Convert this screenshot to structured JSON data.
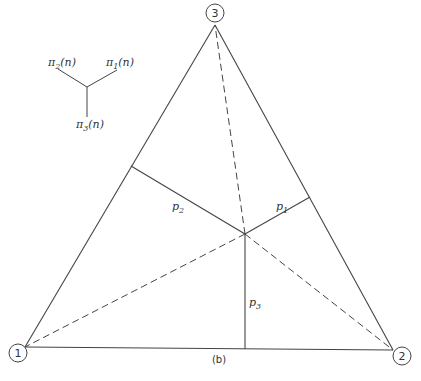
{
  "diagram": {
    "caption": "(b)",
    "colors": {
      "line": "#444444",
      "background": "#ffffff"
    },
    "vertices": [
      {
        "id": "1",
        "label": "1",
        "x": 25,
        "y": 347,
        "circle_x": 18,
        "circle_y": 353
      },
      {
        "id": "2",
        "label": "2",
        "x": 393,
        "y": 350,
        "circle_x": 402,
        "circle_y": 356
      },
      {
        "id": "3",
        "label": "3",
        "x": 215,
        "y": 25,
        "circle_x": 215,
        "circle_y": 13
      }
    ],
    "interior_point": {
      "x": 245,
      "y": 234
    },
    "perpendiculars": [
      {
        "label": "p",
        "sub": "1",
        "foot_x": 310,
        "foot_y": 197,
        "label_x": 276,
        "label_y": 210
      },
      {
        "label": "p",
        "sub": "2",
        "foot_x": 131,
        "foot_y": 166,
        "label_x": 172,
        "label_y": 210
      },
      {
        "label": "p",
        "sub": "3",
        "foot_x": 245,
        "foot_y": 349,
        "label_x": 249,
        "label_y": 306
      }
    ],
    "dashed_lines": [
      "P-to-vertex-1",
      "P-to-vertex-2",
      "P-to-vertex-3"
    ],
    "legend": {
      "center": {
        "x": 87,
        "y": 87
      },
      "labels": [
        {
          "text": "π",
          "sub": "2",
          "arg": "(n)",
          "x": 48,
          "y": 66
        },
        {
          "text": "π",
          "sub": "1",
          "arg": "(n)",
          "x": 106,
          "y": 66
        },
        {
          "text": "π",
          "sub": "3",
          "arg": "(n)",
          "x": 76,
          "y": 128
        }
      ]
    }
  }
}
